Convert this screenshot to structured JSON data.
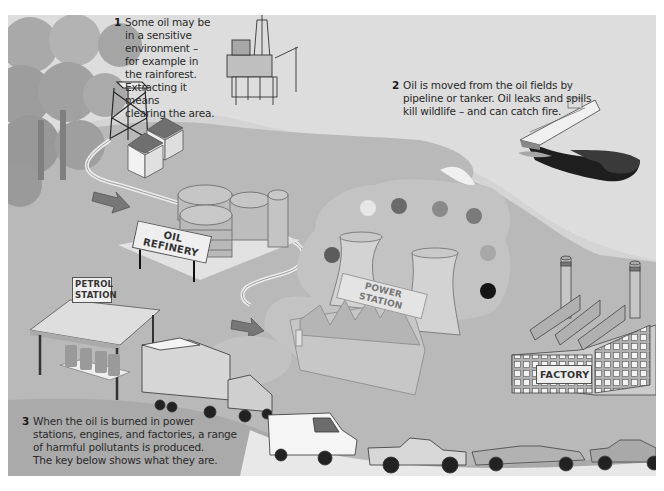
{
  "diagram": {
    "captions": [
      {
        "number": "1",
        "lines": [
          "Some oil may be",
          "in a sensitive",
          "environment –",
          "for example in",
          "the rainforest.",
          "Extracting it means",
          "clearing the area."
        ]
      },
      {
        "number": "2",
        "lines": [
          "Oil is moved from the oil fields by",
          "pipeline or tanker. Oil leaks and spills",
          "kill wildlife – and can catch fire."
        ]
      },
      {
        "number": "3",
        "lines": [
          "When the oil is burned in power",
          "stations, engines, and factories, a range",
          "of harmful pollutants is produced.",
          "The key below shows what they are."
        ]
      }
    ],
    "signs": {
      "refinery": "OIL REFINERY",
      "petrol_line1": "PETROL",
      "petrol_line2": "STATION",
      "power_station": "POWER STATION",
      "factory": "FACTORY"
    },
    "scene_elements": [
      "rainforest-trees",
      "oil-derrick",
      "storage-sheds",
      "offshore-oil-rig",
      "oil-tanker",
      "oil-spill",
      "pipeline",
      "oil-refinery-tanks",
      "petrol-station",
      "power-station-cooling-towers",
      "factory",
      "lorry",
      "van",
      "pickup-truck",
      "convertible-car",
      "saloon-car",
      "flow-arrow"
    ],
    "pollutant_dots": [
      {
        "x": 360,
        "y": 200,
        "shade": "#e6e6e6"
      },
      {
        "x": 391,
        "y": 198,
        "shade": "#6a6a6a"
      },
      {
        "x": 432,
        "y": 201,
        "shade": "#8a8a8a"
      },
      {
        "x": 466,
        "y": 208,
        "shade": "#7a7a7a"
      },
      {
        "x": 324,
        "y": 247,
        "shade": "#5c5c5c"
      },
      {
        "x": 480,
        "y": 245,
        "shade": "#a8a8a8"
      },
      {
        "x": 480,
        "y": 283,
        "shade": "#151515"
      }
    ],
    "colors": {
      "background": "#cfcfcf",
      "sea": "#e4e4e4",
      "land": "#b4b4b4",
      "smoke": "#bdbdbd",
      "text": "#2a2a2a"
    }
  }
}
